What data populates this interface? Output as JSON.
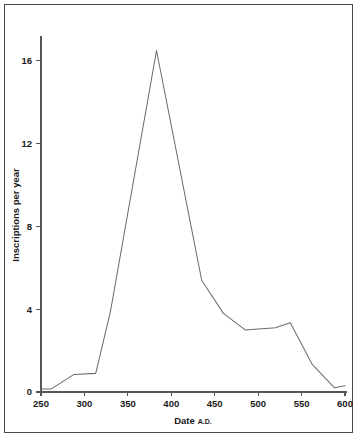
{
  "figure": {
    "background_color": "#ffffff",
    "frame_color": "#4a4a4a",
    "line_color": "#6d6d6d",
    "axis_color": "#555555"
  },
  "chart_data": {
    "type": "line",
    "title": "",
    "xlabel": "Date",
    "xlabel_suffix": "A.D.",
    "ylabel": "Inscriptions per year",
    "xlim": [
      250,
      600
    ],
    "ylim": [
      0,
      17.2
    ],
    "grid": false,
    "legend": false,
    "xticks": [
      250,
      300,
      350,
      400,
      450,
      500,
      550,
      600
    ],
    "xtick_labels": [
      "250",
      "300",
      "350",
      "400",
      "450",
      "500",
      "550",
      "600"
    ],
    "yticks": [
      0,
      4,
      8,
      12,
      16
    ],
    "ytick_labels": [
      "0",
      "4",
      "8",
      "12",
      "16"
    ],
    "series": [
      {
        "name": "Inscriptions per year",
        "x": [
          250,
          262,
          288,
          313,
          330,
          383,
          435,
          460,
          485,
          520,
          537,
          562,
          588,
          600
        ],
        "values": [
          0.15,
          0.15,
          0.85,
          0.9,
          3.9,
          16.5,
          5.4,
          3.8,
          3.0,
          3.1,
          3.35,
          1.35,
          0.2,
          0.3
        ]
      }
    ]
  }
}
